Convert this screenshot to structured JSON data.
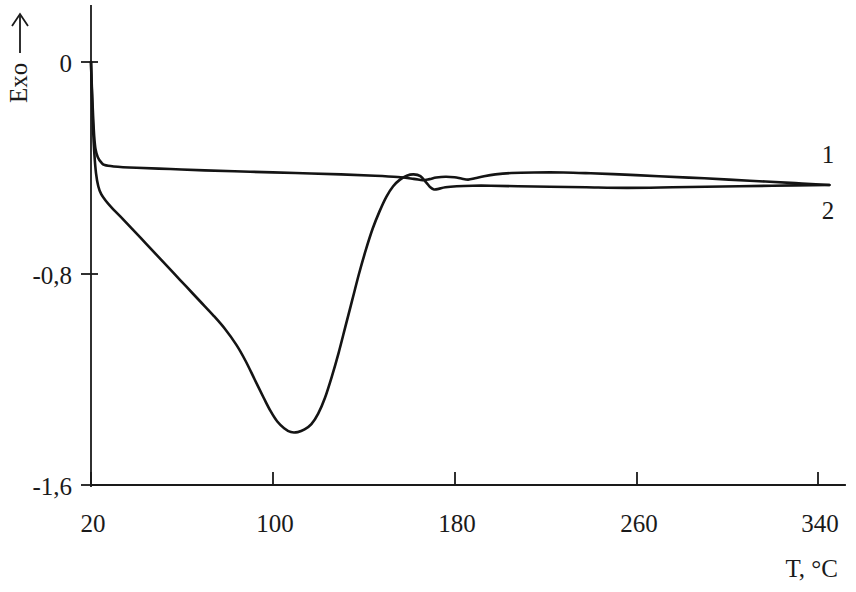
{
  "figure": {
    "background_color": "#ffffff",
    "line_color": "#141414",
    "axis_color": "#1a1a1a"
  },
  "axes": {
    "y_axis_title": "Exo",
    "y_axis_arrow": "up-arrow",
    "x_axis_title": "T, °C",
    "y_ticks": [
      "0",
      "-0,8",
      "-1,6"
    ],
    "x_ticks": [
      "20",
      "100",
      "180",
      "260",
      "340"
    ]
  },
  "curve_labels": {
    "curve1": "1",
    "curve2": "2"
  },
  "chart_data": {
    "type": "line",
    "title": "",
    "subtitle": "",
    "xlabel": "T, °C",
    "ylabel": "Exo →",
    "xlim": [
      20,
      345
    ],
    "ylim": [
      -1.6,
      0.05
    ],
    "xticks": [
      20,
      100,
      180,
      260,
      340
    ],
    "xticklabels": [
      "20",
      "100",
      "180",
      "260",
      "340"
    ],
    "yticks": [
      0,
      -0.8,
      -1.6
    ],
    "yticklabels": [
      "0",
      "-0,8",
      "-1,6"
    ],
    "grid": false,
    "legend": "inline-right-end",
    "annotations": [
      {
        "text": "1",
        "x": 345,
        "y": -0.36,
        "note": "label for curve 1 at right edge, above line"
      },
      {
        "text": "2",
        "x": 345,
        "y": -0.57,
        "note": "label for curve 2 at right edge, below line"
      }
    ],
    "series": [
      {
        "name": "1",
        "label": "1",
        "color": "#141414",
        "points": [
          [
            20.0,
            0.0
          ],
          [
            20.4,
            -0.1
          ],
          [
            20.9,
            -0.2
          ],
          [
            21.4,
            -0.28
          ],
          [
            22.0,
            -0.33
          ],
          [
            23.0,
            -0.36
          ],
          [
            24.5,
            -0.38
          ],
          [
            26.0,
            -0.39
          ],
          [
            30.0,
            -0.395
          ],
          [
            40.0,
            -0.4
          ],
          [
            55.0,
            -0.405
          ],
          [
            70.0,
            -0.41
          ],
          [
            90.0,
            -0.415
          ],
          [
            110.0,
            -0.42
          ],
          [
            130.0,
            -0.425
          ],
          [
            145.0,
            -0.43
          ],
          [
            155.0,
            -0.435
          ],
          [
            162.0,
            -0.442
          ],
          [
            166.0,
            -0.447
          ],
          [
            169.0,
            -0.443
          ],
          [
            172.0,
            -0.437
          ],
          [
            176.0,
            -0.434
          ],
          [
            180.0,
            -0.436
          ],
          [
            183.0,
            -0.441
          ],
          [
            186.0,
            -0.445
          ],
          [
            189.0,
            -0.44
          ],
          [
            193.0,
            -0.432
          ],
          [
            198.0,
            -0.425
          ],
          [
            205.0,
            -0.42
          ],
          [
            215.0,
            -0.418
          ],
          [
            228.0,
            -0.418
          ],
          [
            240.0,
            -0.421
          ],
          [
            255.0,
            -0.426
          ],
          [
            270.0,
            -0.432
          ],
          [
            290.0,
            -0.44
          ],
          [
            310.0,
            -0.449
          ],
          [
            330.0,
            -0.458
          ],
          [
            345.0,
            -0.465
          ]
        ]
      },
      {
        "name": "2",
        "label": "2",
        "color": "#141414",
        "points": [
          [
            20.0,
            0.0
          ],
          [
            20.4,
            -0.12
          ],
          [
            20.9,
            -0.25
          ],
          [
            21.5,
            -0.35
          ],
          [
            22.2,
            -0.42
          ],
          [
            23.2,
            -0.47
          ],
          [
            24.5,
            -0.5
          ],
          [
            26.5,
            -0.525
          ],
          [
            29.0,
            -0.55
          ],
          [
            33.0,
            -0.585
          ],
          [
            38.0,
            -0.63
          ],
          [
            44.0,
            -0.685
          ],
          [
            50.0,
            -0.74
          ],
          [
            56.0,
            -0.795
          ],
          [
            62.0,
            -0.85
          ],
          [
            68.0,
            -0.905
          ],
          [
            74.0,
            -0.96
          ],
          [
            79.0,
            -1.01
          ],
          [
            84.0,
            -1.07
          ],
          [
            88.0,
            -1.13
          ],
          [
            92.0,
            -1.2
          ],
          [
            96.0,
            -1.27
          ],
          [
            99.0,
            -1.32
          ],
          [
            102.0,
            -1.36
          ],
          [
            105.0,
            -1.385
          ],
          [
            108.0,
            -1.4
          ],
          [
            111.0,
            -1.4
          ],
          [
            114.0,
            -1.39
          ],
          [
            117.0,
            -1.37
          ],
          [
            120.0,
            -1.33
          ],
          [
            123.0,
            -1.27
          ],
          [
            126.0,
            -1.19
          ],
          [
            129.0,
            -1.1
          ],
          [
            132.0,
            -1.0
          ],
          [
            135.0,
            -0.9
          ],
          [
            138.0,
            -0.8
          ],
          [
            141.0,
            -0.71
          ],
          [
            144.0,
            -0.63
          ],
          [
            147.0,
            -0.565
          ],
          [
            150.0,
            -0.51
          ],
          [
            153.0,
            -0.47
          ],
          [
            156.0,
            -0.445
          ],
          [
            159.0,
            -0.43
          ],
          [
            162.0,
            -0.425
          ],
          [
            165.0,
            -0.432
          ],
          [
            167.5,
            -0.455
          ],
          [
            169.5,
            -0.475
          ],
          [
            171.0,
            -0.482
          ],
          [
            173.0,
            -0.48
          ],
          [
            176.0,
            -0.474
          ],
          [
            181.0,
            -0.47
          ],
          [
            188.0,
            -0.468
          ],
          [
            196.0,
            -0.468
          ],
          [
            208.0,
            -0.47
          ],
          [
            222.0,
            -0.472
          ],
          [
            238.0,
            -0.474
          ],
          [
            256.0,
            -0.476
          ],
          [
            276.0,
            -0.474
          ],
          [
            298.0,
            -0.471
          ],
          [
            320.0,
            -0.468
          ],
          [
            345.0,
            -0.465
          ]
        ]
      }
    ]
  }
}
